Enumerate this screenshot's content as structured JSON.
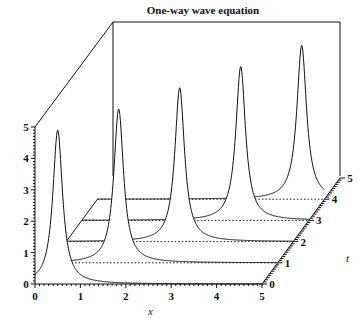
{
  "chart_data": {
    "type": "line",
    "subtype": "3d-waterfall",
    "title": "One-way wave equation",
    "xlabel": "x",
    "ylabel": "t",
    "zlabel": "",
    "x_ticks": [
      "0",
      "1",
      "2",
      "3",
      "4",
      "5"
    ],
    "t_ticks": [
      "0",
      "1",
      "2",
      "3",
      "4",
      "5"
    ],
    "z_ticks": [
      "0",
      "1",
      "2",
      "3",
      "4",
      "5"
    ],
    "xlim": [
      0,
      5
    ],
    "tlim": [
      0,
      5
    ],
    "zlim": [
      0,
      5
    ],
    "grid": false,
    "legend": null,
    "series": [
      {
        "name": "t=0",
        "t": 0,
        "peak_x": 0.5,
        "peak_height": 4.9
      },
      {
        "name": "t=1",
        "t": 1,
        "peak_x": 1.5,
        "peak_height": 4.9
      },
      {
        "name": "t=2",
        "t": 2,
        "peak_x": 2.5,
        "peak_height": 4.9
      },
      {
        "name": "t=3",
        "t": 3,
        "peak_x": 3.5,
        "peak_height": 4.9
      },
      {
        "name": "t=4",
        "t": 4,
        "peak_x": 4.5,
        "peak_height": 4.9
      }
    ]
  }
}
